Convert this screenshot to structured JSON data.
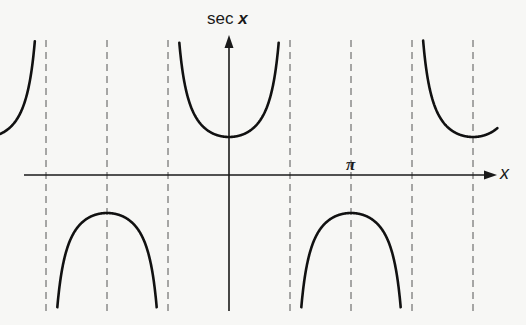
{
  "chart_data": {
    "type": "line",
    "title": "",
    "xlabel": "x",
    "ylabel": "sec x",
    "x_tick_labels": [
      {
        "value": 3.14159,
        "label": "π"
      }
    ],
    "xlim": [
      -4.71,
      7.0
    ],
    "ylim": [
      -3.55,
      3.55
    ],
    "grid": false,
    "legend": null,
    "dashed_verticals": [
      "-5π/2",
      "-3π/2",
      "-π",
      "-π/2",
      "π/2",
      "π",
      "3π/2",
      "2π"
    ],
    "asymptotes": [
      "-5π/2",
      "-3π/2",
      "-π/2",
      "π/2",
      "3π/2",
      "5π/2"
    ],
    "series": [
      {
        "name": "sec x",
        "branches": [
          {
            "x_range": [
              "-2.68π (≈-4.7)",
              "-5π/2"
            ],
            "note": "fragment of branch centered at -2π, y ≥ 1, rising toward asymptote"
          },
          {
            "x_range": [
              "-3π/2",
              "-π/2"
            ],
            "extremum": {
              "x": "-π",
              "y": -1
            },
            "direction": "down"
          },
          {
            "x_range": [
              "-π/2",
              "π/2"
            ],
            "extremum": {
              "x": 0,
              "y": 1
            },
            "direction": "up"
          },
          {
            "x_range": [
              "π/2",
              "3π/2"
            ],
            "extremum": {
              "x": "π",
              "y": -1
            },
            "direction": "down"
          },
          {
            "x_range": [
              "3π/2",
              "2.2π"
            ],
            "extremum": {
              "x": "2π",
              "y": 1
            },
            "direction": "up"
          }
        ]
      }
    ]
  },
  "labels": {
    "y_axis_func": "sec ",
    "y_axis_var": "x",
    "x_axis": "x",
    "pi_tick": "π"
  },
  "colors": {
    "background": "#f7f7f5",
    "curve": "#111111",
    "axes": "#1a1a1a",
    "dashed": "#555555"
  }
}
